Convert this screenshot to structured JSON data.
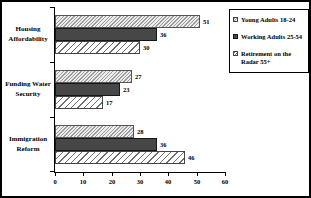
{
  "chart_data": {
    "type": "bar",
    "orientation": "horizontal",
    "title": "",
    "categories": [
      "Housing Affordability",
      "Funding Water Security",
      "Immigration Reform"
    ],
    "series": [
      {
        "name": "Young Adults 18-24",
        "values": [
          51,
          27,
          28
        ],
        "pattern": "hatch-fine"
      },
      {
        "name": "Working Adults 25-54",
        "values": [
          36,
          23,
          36
        ],
        "pattern": "solid-dark"
      },
      {
        "name": "Retirement on the Radar 55+",
        "values": [
          30,
          17,
          46
        ],
        "pattern": "hatch-wide"
      }
    ],
    "value_labels": true,
    "xlim": [
      0,
      60
    ],
    "x_ticks": [
      "0",
      "10",
      "20",
      "30",
      "40",
      "50",
      "60"
    ],
    "grid": false,
    "legend_position": "right",
    "colors": {
      "background": "#ffffff",
      "axis": "#000000",
      "solid_bar": "#474747",
      "hatch_line": "#8a8a8a",
      "text": "#000000"
    }
  }
}
